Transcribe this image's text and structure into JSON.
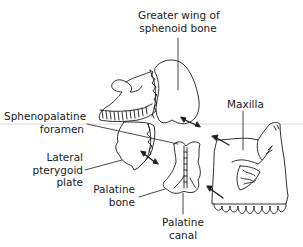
{
  "diagram": {
    "labels": {
      "greater_wing": {
        "line1": "Greater wing of",
        "line2": "sphenoid bone"
      },
      "maxilla": {
        "line1": "Maxilla"
      },
      "sphenopalatine_foramen": {
        "line1": "Sphenopalatine",
        "line2": "foramen"
      },
      "lateral_pterygoid_plate": {
        "line1": "Lateral",
        "line2": "pterygoid",
        "line3": "plate"
      },
      "palatine_bone": {
        "line1": "Palatine",
        "line2": "bone"
      },
      "palatine_canal": {
        "line1": "Palatine",
        "line2": "canal"
      }
    },
    "colors": {
      "line": "#1a1a1a",
      "background": "#ffffff"
    }
  }
}
